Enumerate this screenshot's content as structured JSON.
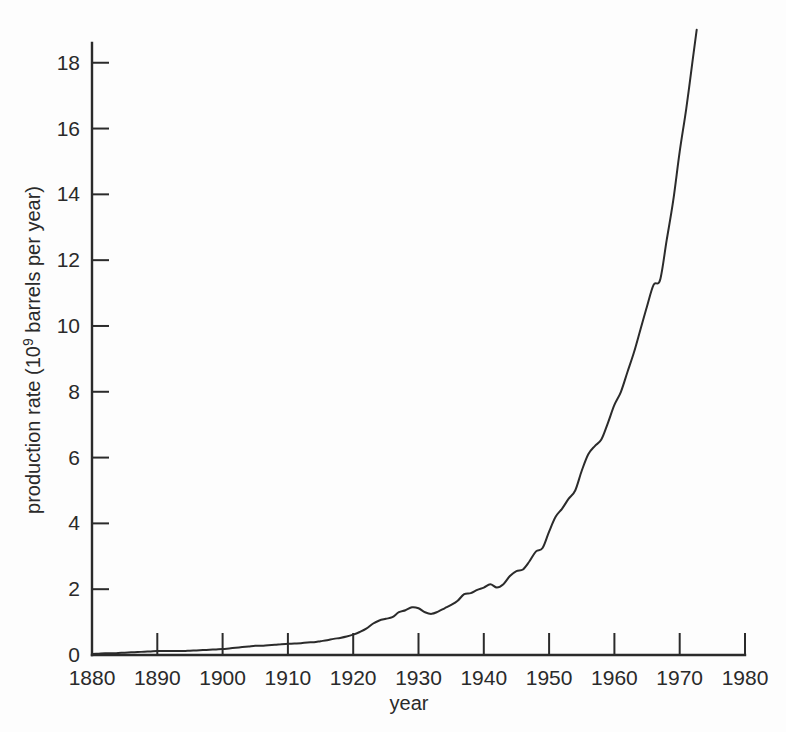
{
  "chart_data": {
    "type": "line",
    "title": "",
    "xlabel": "year",
    "ylabel": "production rate (10",
    "ylabel_sup": "9",
    "ylabel_tail": " barrels per year)",
    "xlim": [
      1880,
      1980
    ],
    "ylim": [
      0,
      18.6
    ],
    "grid": false,
    "legend": null,
    "xticks": [
      1880,
      1890,
      1900,
      1910,
      1920,
      1930,
      1940,
      1950,
      1960,
      1970,
      1980
    ],
    "xtick_labels": [
      "1880",
      "1890",
      "1900",
      "1910",
      "1920",
      "1930",
      "1940",
      "1950",
      "1960",
      "1970",
      "1980"
    ],
    "yticks": [
      0,
      2,
      4,
      6,
      8,
      10,
      12,
      14,
      16,
      18
    ],
    "ytick_labels": [
      "0",
      "2",
      "4",
      "6",
      "8",
      "10",
      "12",
      "14",
      "16",
      "18"
    ],
    "line_color": "#2b2b2b",
    "line_width": 2.0,
    "series": [
      {
        "name": "world crude oil production rate",
        "x": [
          1880,
          1881,
          1882,
          1883,
          1884,
          1885,
          1886,
          1887,
          1888,
          1889,
          1890,
          1891,
          1892,
          1893,
          1894,
          1895,
          1896,
          1897,
          1898,
          1899,
          1900,
          1901,
          1902,
          1903,
          1904,
          1905,
          1906,
          1907,
          1908,
          1909,
          1910,
          1911,
          1912,
          1913,
          1914,
          1915,
          1916,
          1917,
          1918,
          1919,
          1920,
          1921,
          1922,
          1923,
          1924,
          1925,
          1926,
          1927,
          1928,
          1929,
          1930,
          1931,
          1932,
          1933,
          1934,
          1935,
          1936,
          1937,
          1938,
          1939,
          1940,
          1941,
          1942,
          1943,
          1944,
          1945,
          1946,
          1947,
          1948,
          1949,
          1950,
          1951,
          1952,
          1953,
          1954,
          1955,
          1956,
          1957,
          1958,
          1959,
          1960,
          1961,
          1962,
          1963,
          1964,
          1965,
          1966,
          1967,
          1968,
          1969,
          1970,
          1971,
          1972,
          1972.6
        ],
        "values": [
          0.03,
          0.04,
          0.05,
          0.05,
          0.06,
          0.07,
          0.08,
          0.09,
          0.1,
          0.11,
          0.12,
          0.12,
          0.12,
          0.12,
          0.12,
          0.13,
          0.14,
          0.15,
          0.16,
          0.17,
          0.18,
          0.2,
          0.22,
          0.24,
          0.26,
          0.28,
          0.28,
          0.3,
          0.31,
          0.33,
          0.34,
          0.35,
          0.36,
          0.38,
          0.39,
          0.42,
          0.45,
          0.49,
          0.52,
          0.56,
          0.62,
          0.7,
          0.8,
          0.95,
          1.05,
          1.1,
          1.15,
          1.3,
          1.36,
          1.45,
          1.42,
          1.3,
          1.25,
          1.32,
          1.42,
          1.52,
          1.65,
          1.85,
          1.88,
          1.98,
          2.05,
          2.15,
          2.05,
          2.15,
          2.4,
          2.55,
          2.6,
          2.85,
          3.15,
          3.25,
          3.75,
          4.2,
          4.45,
          4.75,
          5.0,
          5.6,
          6.1,
          6.35,
          6.55,
          7.05,
          7.6,
          8.0,
          8.6,
          9.2,
          9.9,
          10.6,
          11.25,
          11.4,
          12.6,
          13.8,
          15.3,
          16.6,
          18.1,
          19.0
        ],
        "color": "#2b2b2b"
      }
    ],
    "annotations": [
      {
        "label": "Great Depression dip",
        "x_range": [
          1929,
          1932
        ],
        "peak": 1.45,
        "trough": 1.25
      },
      {
        "label": "WWII fluctuation",
        "x_range": [
          1941,
          1943
        ],
        "value": 2.05
      },
      {
        "label": "1958 recession plateau",
        "x": 1958,
        "value": 6.55
      },
      {
        "label": "mid-1960s kink",
        "x": 1967,
        "value": 11.4
      }
    ]
  },
  "geometry": {
    "plot_left": 92,
    "plot_right": 745,
    "plot_bottom": 655,
    "axis_top": 43,
    "x_min": 1880,
    "x_max": 1980,
    "y_min": 0,
    "y_max": 18.6
  }
}
